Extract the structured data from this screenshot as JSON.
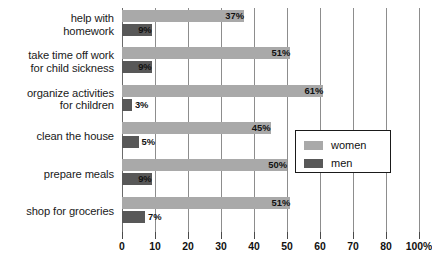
{
  "chart_data": {
    "type": "bar",
    "orientation": "horizontal",
    "title": "",
    "subtitle": "",
    "xlabel": "",
    "ylabel": "",
    "grid": true,
    "legend_position": "right-middle",
    "categories": [
      "help with homework",
      "take time off work for child sickness",
      "organize activities for children",
      "clean the house",
      "prepare meals",
      "shop for groceries"
    ],
    "category_lines": [
      [
        "help with",
        "homework"
      ],
      [
        "take time off work",
        "for child sickness"
      ],
      [
        "organize activities",
        "for children"
      ],
      [
        "clean the house"
      ],
      [
        "prepare meals"
      ],
      [
        "shop for groceries"
      ]
    ],
    "series": [
      {
        "name": "women",
        "color": "#a9a9a9",
        "values": [
          37,
          51,
          61,
          45,
          50,
          51
        ],
        "labels": [
          "37%",
          "51%",
          "61%",
          "45%",
          "50%",
          "51%"
        ]
      },
      {
        "name": "men",
        "color": "#585858",
        "values": [
          9,
          9,
          3,
          5,
          9,
          7
        ],
        "labels": [
          "9%",
          "9%",
          "3%",
          "5%",
          "9%",
          "7%"
        ]
      }
    ],
    "xlim": [
      0,
      90
    ],
    "xticks": [
      0,
      10,
      20,
      30,
      40,
      50,
      60,
      70,
      80,
      90
    ],
    "xtick_labels": [
      "0",
      "10",
      "20",
      "30",
      "40",
      "50",
      "60",
      "70",
      "80",
      "100%"
    ]
  },
  "legend": {
    "items": [
      {
        "label": "women",
        "color": "#a9a9a9"
      },
      {
        "label": "men",
        "color": "#585858"
      }
    ]
  },
  "colors": {
    "women": "#a9a9a9",
    "men": "#585858",
    "gridline": "#8d8d8d",
    "text": "#111111",
    "background": "#ffffff"
  }
}
